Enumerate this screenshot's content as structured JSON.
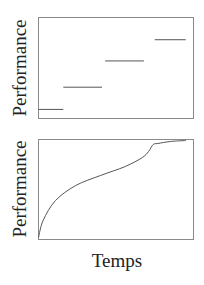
{
  "chart_data": [
    {
      "type": "line",
      "subtype": "step",
      "title": "",
      "xlabel": "",
      "ylabel": "Performance",
      "grid": false,
      "legend": null,
      "x_ticks": [],
      "y_ticks": [],
      "segments": [
        {
          "x_start": 0.0,
          "x_end": 0.16,
          "y": 0.09
        },
        {
          "x_start": 0.16,
          "x_end": 0.41,
          "y": 0.31
        },
        {
          "x_start": 0.43,
          "x_end": 0.68,
          "y": 0.57
        },
        {
          "x_start": 0.75,
          "x_end": 0.95,
          "y": 0.78
        }
      ],
      "xlim": [
        0,
        1
      ],
      "ylim": [
        0,
        1
      ]
    },
    {
      "type": "line",
      "title": "",
      "xlabel": "Temps",
      "ylabel": "Performance",
      "grid": false,
      "legend": null,
      "x_ticks": [],
      "y_ticks": [],
      "x": [
        0.0,
        0.03,
        0.11,
        0.24,
        0.4,
        0.56,
        0.67,
        0.71,
        0.74,
        0.77,
        0.85,
        0.95
      ],
      "values": [
        0.02,
        0.19,
        0.39,
        0.54,
        0.64,
        0.73,
        0.82,
        0.88,
        0.95,
        0.96,
        0.98,
        0.99
      ],
      "xlim": [
        0,
        1
      ],
      "ylim": [
        0,
        1
      ]
    }
  ],
  "labels": {
    "top_ylabel": "Performance",
    "bottom_ylabel": "Performance",
    "bottom_xlabel": "Temps"
  },
  "colors": {
    "axis_frame": "#8a8a8a",
    "line": "#555555",
    "text": "#222222"
  }
}
